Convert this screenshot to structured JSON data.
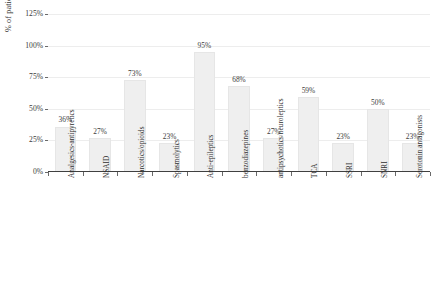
{
  "chart_data": {
    "type": "bar",
    "title": "",
    "xlabel": "",
    "ylabel": "% of patient cohort (n=22)",
    "ylim": [
      0,
      125
    ],
    "ytick_labels": [
      "125%",
      "100%",
      "75%",
      "50%",
      "25%",
      "0%"
    ],
    "ytick_values": [
      125,
      100,
      75,
      50,
      25,
      0
    ],
    "grid": true,
    "legend": "none",
    "categories": [
      "Analgesics-antipyretics",
      "NSAID",
      "Narcotics/opioids",
      "Spasmolytics",
      "Anti-epileptics",
      "benzodiazepines",
      "antipsychotics/neuroleptics",
      "TCA",
      "SSRI",
      "SNRI",
      "Serotonin antagonists"
    ],
    "values": [
      36,
      27,
      73,
      23,
      95,
      68,
      27,
      59,
      23,
      50,
      23
    ],
    "value_labels": [
      "36%",
      "27%",
      "73%",
      "23%",
      "95%",
      "68%",
      "27%",
      "59%",
      "23%",
      "50%",
      "23%"
    ],
    "colors": {
      "bar_fill": "#efefef",
      "bar_stroke": "#e6e6e6",
      "gridline": "#ededed",
      "axis": "#404040",
      "text": "#3a3a3a",
      "background": "#ffffff"
    }
  }
}
